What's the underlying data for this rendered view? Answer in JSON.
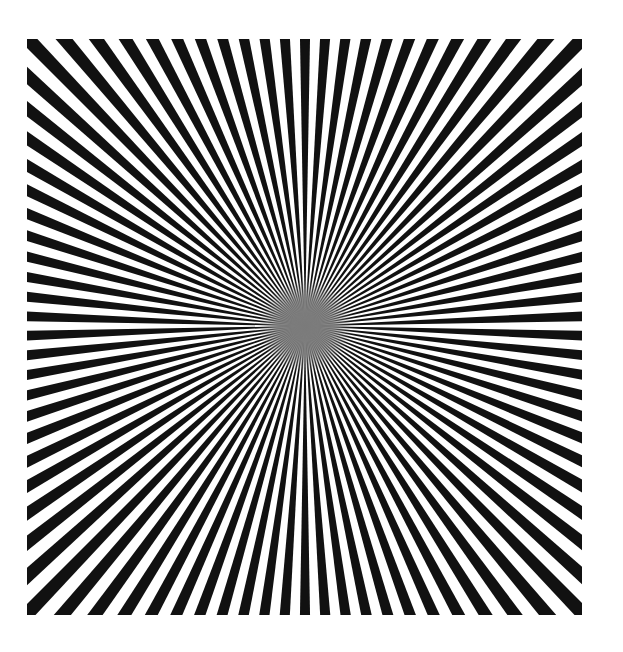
{
  "image": {
    "subject": "Siemens star radial pattern",
    "spoke_count": 90,
    "colors": {
      "spoke": "#111111",
      "background": "#ffffff",
      "center_blur": "#7a7a7a"
    }
  }
}
